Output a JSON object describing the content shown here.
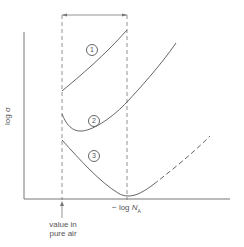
{
  "diagram": {
    "y_axis_label": "log σ",
    "x_axis_label_prefix": "− log ",
    "x_axis_label_var": "N",
    "x_axis_label_sub": "A",
    "annotation_line1": "value in",
    "annotation_line2": "pure air",
    "curves": [
      {
        "id": "1",
        "label": "1",
        "style": "solid"
      },
      {
        "id": "2",
        "label": "2",
        "style": "solid"
      },
      {
        "id": "3",
        "label": "3",
        "style": "solid then dashed"
      }
    ],
    "colors": {
      "line": "#666666",
      "text": "#555555",
      "background": "#ffffff"
    }
  }
}
